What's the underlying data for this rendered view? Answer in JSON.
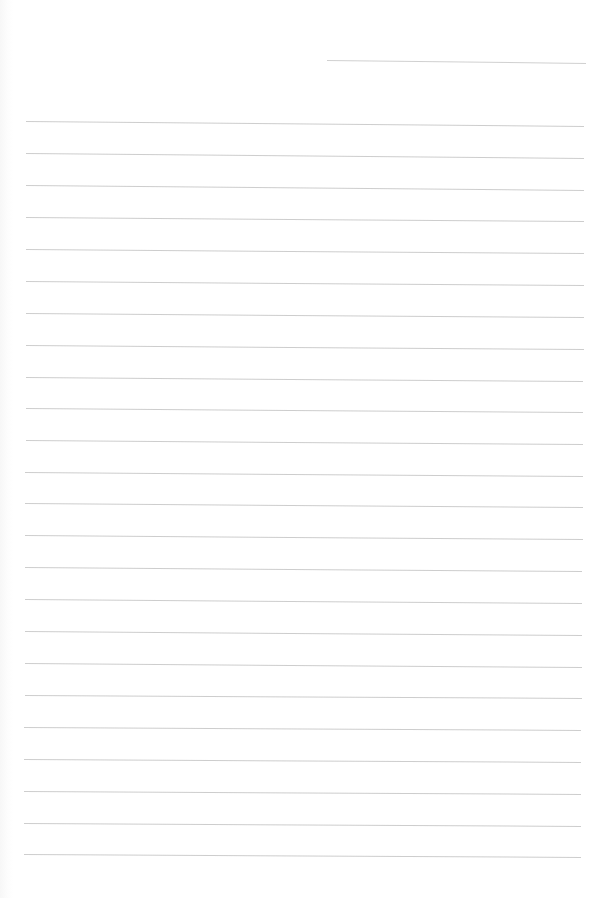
{
  "document": {
    "type": "blank lined paper",
    "line_color": "#c4c4c4",
    "background_color": "#ffffff",
    "header_line": {
      "x1": 327,
      "y1": 60,
      "x2": 586,
      "y2": 63
    },
    "ruled_lines": [
      {
        "x1": 26,
        "y1": 121,
        "x2": 584,
        "y2": 126
      },
      {
        "x1": 26,
        "y1": 153,
        "x2": 584,
        "y2": 158
      },
      {
        "x1": 26,
        "y1": 185,
        "x2": 584,
        "y2": 190
      },
      {
        "x1": 26,
        "y1": 217,
        "x2": 584,
        "y2": 221
      },
      {
        "x1": 26,
        "y1": 249,
        "x2": 584,
        "y2": 253
      },
      {
        "x1": 26,
        "y1": 281,
        "x2": 584,
        "y2": 285
      },
      {
        "x1": 26,
        "y1": 313,
        "x2": 584,
        "y2": 317
      },
      {
        "x1": 26,
        "y1": 345,
        "x2": 584,
        "y2": 349
      },
      {
        "x1": 26,
        "y1": 377,
        "x2": 583,
        "y2": 381
      },
      {
        "x1": 26,
        "y1": 408,
        "x2": 583,
        "y2": 412
      },
      {
        "x1": 26,
        "y1": 440,
        "x2": 583,
        "y2": 444
      },
      {
        "x1": 25,
        "y1": 472,
        "x2": 583,
        "y2": 476
      },
      {
        "x1": 25,
        "y1": 503,
        "x2": 583,
        "y2": 507
      },
      {
        "x1": 25,
        "y1": 535,
        "x2": 583,
        "y2": 539
      },
      {
        "x1": 25,
        "y1": 567,
        "x2": 582,
        "y2": 571
      },
      {
        "x1": 25,
        "y1": 599,
        "x2": 582,
        "y2": 603
      },
      {
        "x1": 25,
        "y1": 631,
        "x2": 582,
        "y2": 635
      },
      {
        "x1": 25,
        "y1": 663,
        "x2": 582,
        "y2": 667
      },
      {
        "x1": 25,
        "y1": 695,
        "x2": 582,
        "y2": 698
      },
      {
        "x1": 24,
        "y1": 727,
        "x2": 581,
        "y2": 730
      },
      {
        "x1": 24,
        "y1": 759,
        "x2": 581,
        "y2": 762
      },
      {
        "x1": 24,
        "y1": 791,
        "x2": 581,
        "y2": 794
      },
      {
        "x1": 24,
        "y1": 823,
        "x2": 581,
        "y2": 826
      },
      {
        "x1": 24,
        "y1": 854,
        "x2": 581,
        "y2": 857
      }
    ]
  }
}
